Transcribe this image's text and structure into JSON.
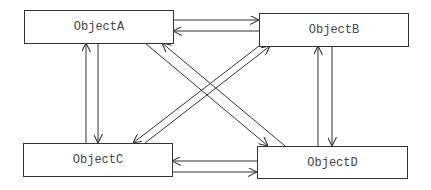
{
  "diagram": {
    "nodes": [
      {
        "id": "A",
        "label": "ObjectA",
        "x": 24,
        "y": 10,
        "w": 149,
        "h": 33
      },
      {
        "id": "B",
        "label": "ObjectB",
        "x": 259,
        "y": 13,
        "w": 149,
        "h": 33
      },
      {
        "id": "C",
        "label": "ObjectC",
        "x": 23,
        "y": 143,
        "w": 149,
        "h": 33
      },
      {
        "id": "D",
        "label": "ObjectD",
        "x": 257,
        "y": 146,
        "w": 150,
        "h": 32
      }
    ],
    "edges": [
      {
        "from": "A",
        "to": "B"
      },
      {
        "from": "B",
        "to": "A"
      },
      {
        "from": "C",
        "to": "A"
      },
      {
        "from": "A",
        "to": "C"
      },
      {
        "from": "D",
        "to": "B"
      },
      {
        "from": "B",
        "to": "D"
      },
      {
        "from": "D",
        "to": "C"
      },
      {
        "from": "C",
        "to": "D"
      },
      {
        "from": "A",
        "to": "D"
      },
      {
        "from": "D",
        "to": "A"
      },
      {
        "from": "B",
        "to": "C"
      },
      {
        "from": "C",
        "to": "B"
      }
    ],
    "colors": {
      "stroke": "#333333",
      "text": "#444444",
      "background": "#ffffff"
    }
  }
}
